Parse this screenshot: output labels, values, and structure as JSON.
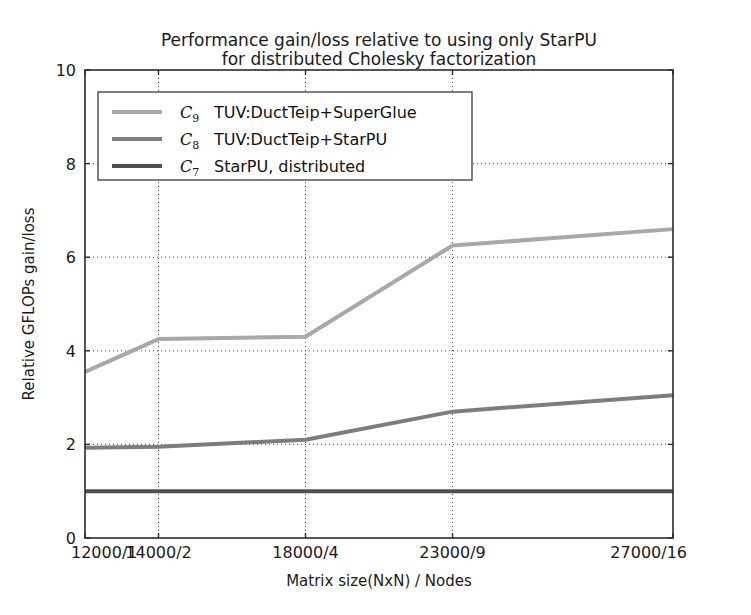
{
  "chart_data": {
    "type": "line",
    "title_line1": "Performance gain/loss relative to using only StarPU",
    "title_line2": "for distributed Cholesky factorization",
    "xlabel": "Matrix size(NxN) / Nodes",
    "ylabel": "Relative GFLOPs gain/loss",
    "categories": [
      "12000/1",
      "14000/2",
      "18000/4",
      "23000/9",
      "27000/16"
    ],
    "x_positions": [
      0,
      1,
      3,
      5,
      8
    ],
    "xlim": [
      0,
      8
    ],
    "ylim": [
      0,
      10
    ],
    "yticks": [
      0,
      2,
      4,
      6,
      8,
      10
    ],
    "ytick_labels": [
      "0",
      "2",
      "4",
      "6",
      "8",
      "10"
    ],
    "xtick_labels": [
      "12000/1",
      "14000/2",
      "18000/4",
      "23000/9",
      "27000/16"
    ],
    "grid": true,
    "grid_style": "dotted",
    "legend_position": "upper left",
    "series": [
      {
        "name": "C9",
        "symbol": "C",
        "subscript": "9",
        "label": "TUV:DuctTeip+SuperGlue",
        "color": "#a8a8a8",
        "linewidth": 4,
        "values": [
          3.55,
          4.25,
          4.3,
          6.25,
          6.6
        ]
      },
      {
        "name": "C8",
        "symbol": "C",
        "subscript": "8",
        "label": "TUV:DuctTeip+StarPU",
        "color": "#7d7d7d",
        "linewidth": 4,
        "values": [
          1.93,
          1.95,
          2.1,
          2.7,
          3.05
        ]
      },
      {
        "name": "C7",
        "symbol": "C",
        "subscript": "7",
        "label": "StarPU, distributed",
        "color": "#4f4f4f",
        "linewidth": 4,
        "values": [
          1.0,
          1.0,
          1.0,
          1.0,
          1.0
        ]
      }
    ]
  },
  "figure": {
    "background": "#ffffff",
    "axes_color": "#2b2b2b"
  }
}
